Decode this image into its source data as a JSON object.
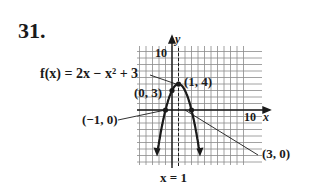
{
  "problem": {
    "number": "31."
  },
  "chart_data": {
    "type": "line",
    "title": "",
    "function_label": "f(x) = 2x − x² + 3",
    "xlabel": "x",
    "ylabel": "y",
    "xlim": [
      -6,
      11
    ],
    "ylim": [
      -10,
      11
    ],
    "grid": true,
    "tick_labels": {
      "x": [
        "10"
      ],
      "y": [
        "10"
      ]
    },
    "series": [
      {
        "name": "f(x) = 2x − x² + 3",
        "x": [
          -2.3,
          -2,
          -1.5,
          -1,
          -0.5,
          0,
          0.5,
          1,
          1.5,
          2,
          2.5,
          3,
          3.5,
          4,
          4.3
        ],
        "y": [
          -9.9,
          -5,
          -2.25,
          0,
          1.75,
          3,
          3.75,
          4,
          3.75,
          3,
          1.75,
          0,
          -2.25,
          -5,
          -9.9
        ]
      }
    ],
    "axis_of_symmetry": {
      "label": "x = 1",
      "x": 1,
      "style": "dashed"
    },
    "annotations": [
      {
        "label": "(1, 4)",
        "x": 1,
        "y": 4,
        "type": "vertex"
      },
      {
        "label": "(0, 3)",
        "x": 0,
        "y": 3,
        "type": "y-intercept"
      },
      {
        "label": "(−1, 0)",
        "x": -1,
        "y": 0,
        "type": "x-intercept"
      },
      {
        "label": "(3, 0)",
        "x": 3,
        "y": 0,
        "type": "x-intercept"
      }
    ]
  },
  "labels": {
    "function": "f(x) = 2x − x² + 3",
    "y_axis": "y",
    "x_axis": "x",
    "y_tick": "10",
    "x_tick": "10",
    "vertex": "(1, 4)",
    "y_intercept": "(0, 3)",
    "x_intercept_left": "(−1, 0)",
    "x_intercept_right": "(3, 0)",
    "symmetry": "x = 1"
  }
}
